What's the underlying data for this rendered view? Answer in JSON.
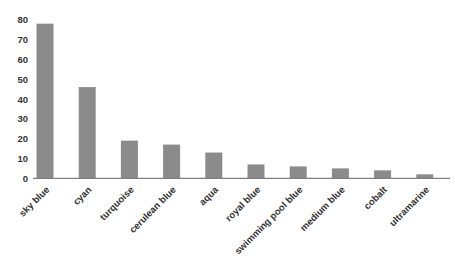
{
  "chart_data": {
    "type": "bar",
    "categories": [
      "sky blue",
      "cyan",
      "turquoise",
      "cerulean blue",
      "aqua",
      "royal blue",
      "swimming pool blue",
      "medium blue",
      "cobalt",
      "ultramarine"
    ],
    "values": [
      78,
      46,
      19,
      17,
      13,
      7,
      6,
      5,
      4,
      2
    ],
    "title": "",
    "xlabel": "",
    "ylabel": "",
    "ylim": [
      0,
      80
    ],
    "yticks": [
      0,
      10,
      20,
      30,
      40,
      50,
      60,
      70,
      80
    ],
    "grid": true,
    "legend_position": "none",
    "colors": {
      "bar": "#8b8b8b",
      "gridline": "#d7d7d7",
      "gridline_fade": "#ebebeb",
      "axis_line": "#7f7f7f",
      "tick_text": "#333333",
      "background": "#ffffff"
    }
  }
}
